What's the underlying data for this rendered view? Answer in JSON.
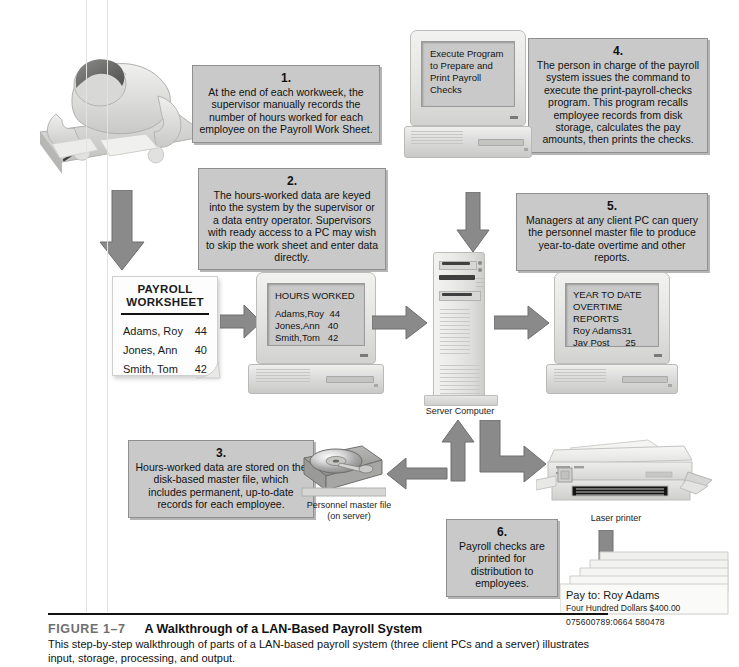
{
  "figure": {
    "number": "FIGURE 1–7",
    "title": "A Walkthrough of a LAN-Based Payroll System",
    "body": "This step-by-step walkthrough of parts of a LAN-based payroll system (three client PCs and a server) illustrates input, storage, processing, and output."
  },
  "steps": [
    {
      "num": "1.",
      "text": "At the end of each workweek, the supervisor manually records the number of hours worked for each employee on the Payroll Work Sheet."
    },
    {
      "num": "2.",
      "text": "The hours-worked data are keyed into the system by the supervisor or a data entry operator. Supervisors with ready access to a PC may wish to skip the work sheet and enter data directly."
    },
    {
      "num": "3.",
      "text": "Hours-worked data are stored on the disk-based master file, which includes permanent, up-to-date records for each employee."
    },
    {
      "num": "4.",
      "text": "The person in charge of the payroll system issues the command to execute the print-payroll-checks program. This program recalls employee records from disk storage, calculates the pay amounts, then prints the checks."
    },
    {
      "num": "5.",
      "text": "Managers at any client PC can query the personnel master file to produce year-to-date overtime and other reports."
    },
    {
      "num": "6.",
      "text": "Payroll checks are printed for distribution to employees."
    }
  ],
  "worksheet": {
    "title_line1": "PAYROLL",
    "title_line2": "WORKSHEET",
    "rows": [
      {
        "name": "Adams, Roy",
        "hours": "44"
      },
      {
        "name": "Jones, Ann",
        "hours": "40"
      },
      {
        "name": "Smith, Tom",
        "hours": "42"
      }
    ]
  },
  "screens": {
    "execute": {
      "lines": [
        "Execute Program",
        "to Prepare and",
        "Print Payroll",
        "Checks"
      ]
    },
    "hours_worked": {
      "title": "HOURS WORKED",
      "lines": [
        "Adams,Roy  44",
        "Jones,Ann   40",
        "Smith,Tom   42"
      ]
    },
    "ytd_reports": {
      "lines": [
        "YEAR TO DATE",
        "OVERTIME",
        "REPORTS",
        "Roy Adams31",
        "Jay Post      25"
      ]
    }
  },
  "device_labels": {
    "server": "Server Computer",
    "disk_line1": "Personnel master file",
    "disk_line2": "(on server)",
    "printer": "Laser printer"
  },
  "check": {
    "pay_to": "Pay to: Roy Adams",
    "amount_words": "Four Hundred Dollars $400.00",
    "micr": "075600789:0664  580478"
  },
  "colors": {
    "callout_fill": "#c9c9c9",
    "callout_border": "#8f8f8f",
    "arrow_fill": "#8a8a8a",
    "screen_fill": "#c9c9c9",
    "figure_number": "#6f6f6f",
    "ink": "#111111"
  }
}
